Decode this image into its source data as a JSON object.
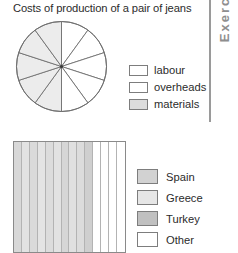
{
  "left_clip_text": "s",
  "sidebar": {
    "label": "Exercise",
    "color": "#8e8e8e"
  },
  "pie_chart": {
    "title": "Costs of production of a pair of jeans",
    "legend": [
      {
        "label": "labour",
        "color": "#ffffff"
      },
      {
        "label": "overheads",
        "color": "#ffffff"
      },
      {
        "label": "materials",
        "color": "#dcdcdc"
      }
    ]
  },
  "bar_chart": {
    "legend": [
      {
        "label": "Spain",
        "color": "#d2d2d2"
      },
      {
        "label": "Greece",
        "color": "#e6e6e6"
      },
      {
        "label": "Turkey",
        "color": "#c0c0c0"
      },
      {
        "label": "Other",
        "color": "#ffffff"
      }
    ]
  },
  "chart_data": [
    {
      "type": "pie",
      "title": "Costs of production of a pair of jeans",
      "xlabel": "",
      "ylabel": "",
      "grid": false,
      "legend_position": "right",
      "total_sectors": 10,
      "sector_angle_degrees": 36,
      "categories": [
        "labour",
        "overheads",
        "materials"
      ],
      "values": [
        null,
        null,
        null
      ],
      "note": "Blank pie divided into 10 equal 36-degree sectors for the student to shade; right half sectors unshaded (white), left half sectors shaded light grey.",
      "sectors": [
        {
          "index": 1,
          "start_degrees": 0,
          "end_degrees": 36,
          "fill": "#ffffff"
        },
        {
          "index": 2,
          "start_degrees": 36,
          "end_degrees": 72,
          "fill": "#ffffff"
        },
        {
          "index": 3,
          "start_degrees": 72,
          "end_degrees": 108,
          "fill": "#ffffff"
        },
        {
          "index": 4,
          "start_degrees": 108,
          "end_degrees": 144,
          "fill": "#ffffff"
        },
        {
          "index": 5,
          "start_degrees": 144,
          "end_degrees": 180,
          "fill": "#ffffff"
        },
        {
          "index": 6,
          "start_degrees": 180,
          "end_degrees": 216,
          "fill": "#ececec"
        },
        {
          "index": 7,
          "start_degrees": 216,
          "end_degrees": 252,
          "fill": "#ececec"
        },
        {
          "index": 8,
          "start_degrees": 252,
          "end_degrees": 288,
          "fill": "#ececec"
        },
        {
          "index": 9,
          "start_degrees": 288,
          "end_degrees": 324,
          "fill": "#ececec"
        },
        {
          "index": 10,
          "start_degrees": 324,
          "end_degrees": 360,
          "fill": "#ececec"
        }
      ]
    },
    {
      "type": "bar",
      "title": "",
      "xlabel": "",
      "ylabel": "",
      "grid": false,
      "legend_position": "right",
      "orientation": "stacked-horizontal",
      "categories": [
        "Spain",
        "Greece",
        "Turkey",
        "Other"
      ],
      "values": [
        null,
        null,
        null,
        null
      ],
      "note": "Blank stacked bar divided into 14 equal vertical strips for the student to shade; 10 leftmost strips shaded grey, 4 rightmost strips white.",
      "segments": [
        {
          "index": 1,
          "fill": "#d8d8d8"
        },
        {
          "index": 2,
          "fill": "#e2e2e2"
        },
        {
          "index": 3,
          "fill": "#dadada"
        },
        {
          "index": 4,
          "fill": "#e4e4e4"
        },
        {
          "index": 5,
          "fill": "#dcdcdc"
        },
        {
          "index": 6,
          "fill": "#e2e2e2"
        },
        {
          "index": 7,
          "fill": "#d6d6d6"
        },
        {
          "index": 8,
          "fill": "#e0e0e0"
        },
        {
          "index": 9,
          "fill": "#dcdcdc"
        },
        {
          "index": 10,
          "fill": "#cfcfcf"
        },
        {
          "index": 11,
          "fill": "#ffffff"
        },
        {
          "index": 12,
          "fill": "#ffffff"
        },
        {
          "index": 13,
          "fill": "#ffffff"
        },
        {
          "index": 14,
          "fill": "#ffffff"
        }
      ]
    }
  ]
}
